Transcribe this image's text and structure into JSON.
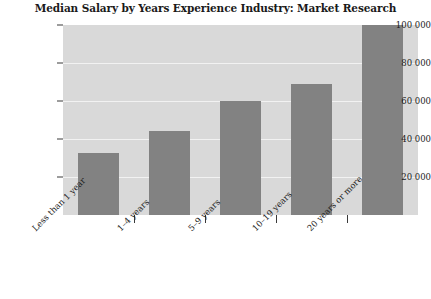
{
  "chart_data": {
    "type": "bar",
    "title": "Median Salary by Years Experience Industry: Market Research",
    "xlabel": "",
    "ylabel": "",
    "categories": [
      "Less than 1 year",
      "1–4 years",
      "5–9 years",
      "10–19 years",
      "20 years or more"
    ],
    "values": [
      32500,
      44000,
      60000,
      69000,
      100000
    ],
    "ylim": [
      0,
      100000
    ],
    "yticks": [
      20000,
      40000,
      60000,
      80000,
      100000
    ],
    "ytick_labels": [
      "20 000",
      "40 000",
      "60 000",
      "80 000",
      "100 000"
    ],
    "grid": true,
    "legend": "none",
    "colors": {
      "bar": "#828282",
      "plot_background": "#d9d9d9",
      "gridline": "#f2f2f2",
      "page_background": "#ffffff",
      "text": "#1c1c1c"
    }
  }
}
